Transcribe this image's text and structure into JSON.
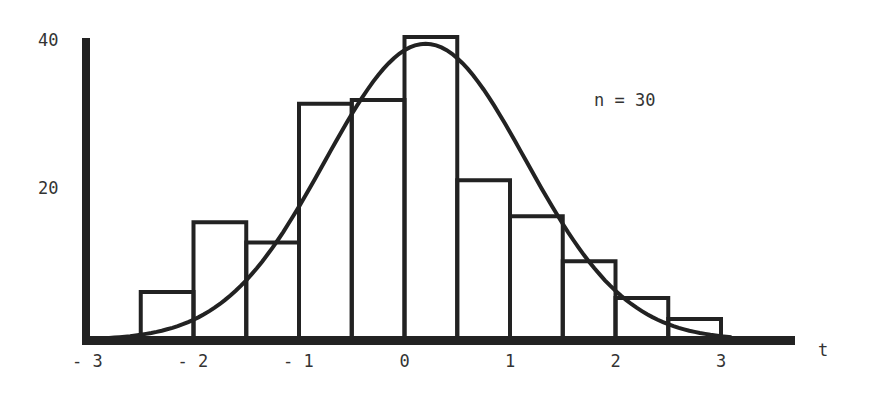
{
  "chart_data": {
    "type": "bar",
    "subtype": "histogram-with-normal-curve",
    "title": "",
    "annotation": "n = 30",
    "xlabel": "t",
    "ylabel": "",
    "x_ticks": [
      "-3",
      "-2",
      "-1",
      "0",
      "1",
      "2",
      "3"
    ],
    "y_ticks": [
      "20",
      "40"
    ],
    "ylim": [
      0,
      40
    ],
    "xlim": [
      -3,
      3.7
    ],
    "bins": [
      {
        "from": -2.5,
        "to": -2.0,
        "value": 6.4
      },
      {
        "from": -2.0,
        "to": -1.5,
        "value": 15.7
      },
      {
        "from": -1.5,
        "to": -1.0,
        "value": 13.0
      },
      {
        "from": -1.0,
        "to": -0.5,
        "value": 31.5
      },
      {
        "from": -0.5,
        "to": 0.0,
        "value": 32.0
      },
      {
        "from": 0.0,
        "to": 0.5,
        "value": 40.4
      },
      {
        "from": 0.5,
        "to": 1.0,
        "value": 21.3
      },
      {
        "from": 1.0,
        "to": 1.5,
        "value": 16.5
      },
      {
        "from": 1.5,
        "to": 2.0,
        "value": 10.5
      },
      {
        "from": 2.0,
        "to": 2.5,
        "value": 5.6
      },
      {
        "from": 2.5,
        "to": 3.0,
        "value": 2.8
      }
    ],
    "curve": {
      "type": "normal",
      "peak_x": 0.2,
      "peak_value": 39.5
    },
    "grid": false,
    "legend": null
  }
}
